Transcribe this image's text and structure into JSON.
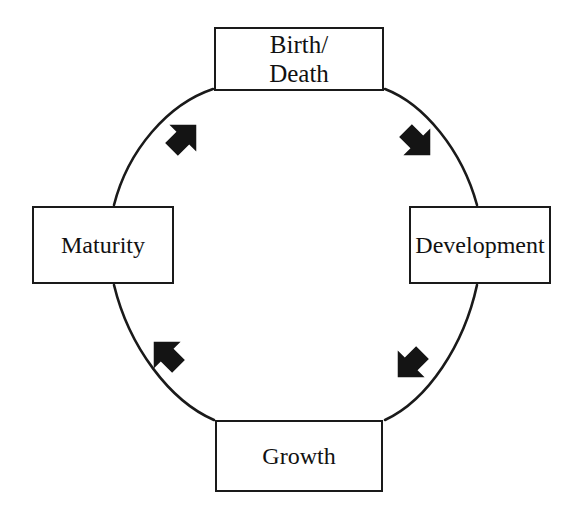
{
  "diagram": {
    "type": "cycle-diagram",
    "direction": "clockwise",
    "background_color": "#ffffff",
    "stroke_color": "#1a1a1a",
    "text_color": "#111111",
    "nodes": [
      {
        "id": "birth-death",
        "label": "Birth/\nDeath",
        "position": "top",
        "order": 1
      },
      {
        "id": "development",
        "label": "Development",
        "position": "right",
        "order": 2
      },
      {
        "id": "growth",
        "label": "Growth",
        "position": "bottom",
        "order": 3
      },
      {
        "id": "maturity",
        "label": "Maturity",
        "position": "left",
        "order": 4
      }
    ],
    "arrows": [
      {
        "id": "arrow-top-right",
        "from": "birth-death",
        "to": "development",
        "direction": "down-right",
        "quadrant": "top-right"
      },
      {
        "id": "arrow-bottom-right",
        "from": "development",
        "to": "growth",
        "direction": "down-left",
        "quadrant": "bottom-right"
      },
      {
        "id": "arrow-bottom-left",
        "from": "growth",
        "to": "maturity",
        "direction": "up-left",
        "quadrant": "bottom-left"
      },
      {
        "id": "arrow-top-left",
        "from": "maturity",
        "to": "birth-death",
        "direction": "up-right",
        "quadrant": "top-left"
      }
    ]
  }
}
